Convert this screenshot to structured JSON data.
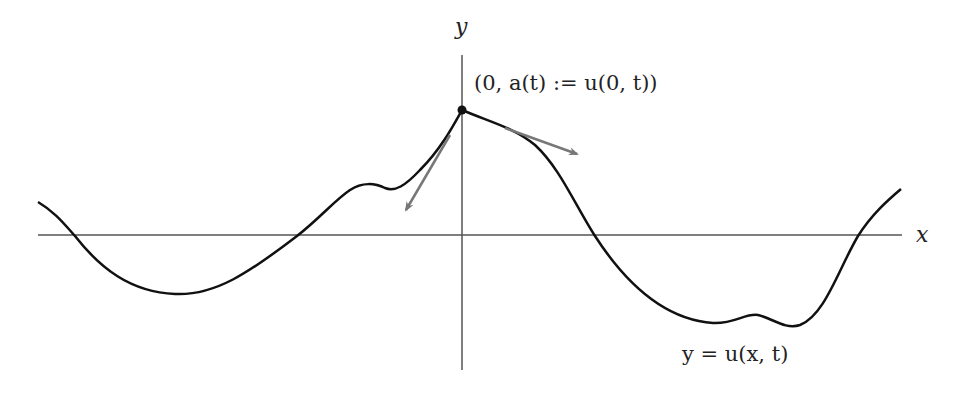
{
  "diagram": {
    "axes": {
      "x_label": "x",
      "y_label": "y",
      "color": "#555555"
    },
    "curve": {
      "label": "y = u(x, t)",
      "color": "#111111"
    },
    "point": {
      "label": "(0, a(t) := u(0, t))",
      "color": "#111111"
    },
    "tangent_arrows": {
      "count": 2,
      "color": "#777777",
      "description": "one-sided tangent directions at the corner point"
    }
  }
}
